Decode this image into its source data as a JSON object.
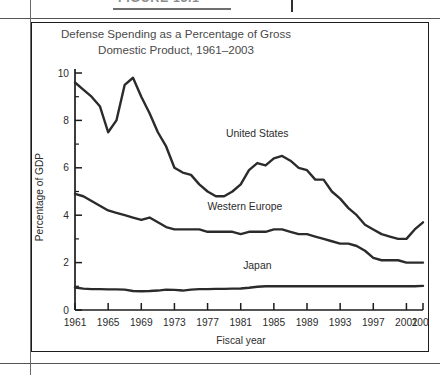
{
  "figure": {
    "caption": "FIGURE 13.1",
    "title_line1": "Defense Spending as a Percentage of Gross",
    "title_line2": "Domestic Product, 1961–2003"
  },
  "chart_data": {
    "type": "line",
    "title": "Defense Spending as a Percentage of Gross Domestic Product, 1961–2003",
    "xlabel": "Fiscal year",
    "ylabel": "Percentage of GDP",
    "xlim": [
      1961,
      2003
    ],
    "ylim": [
      0,
      10
    ],
    "grid": false,
    "legend": "inline labels on series",
    "y_ticks": [
      0,
      2,
      4,
      6,
      8,
      10
    ],
    "y_tick_labels": [
      "0",
      "2",
      "4",
      "6",
      "8",
      "10"
    ],
    "y_minor_ticks": [
      1,
      3,
      5,
      7,
      9
    ],
    "x_ticks": [
      1961,
      1965,
      1969,
      1973,
      1977,
      1981,
      1985,
      1989,
      1993,
      1997,
      2001,
      2003
    ],
    "x_tick_labels": [
      "1961",
      "1965",
      "1969",
      "1973",
      "1977",
      "1981",
      "1985",
      "1989",
      "1993",
      "1997",
      "2001",
      "2003"
    ],
    "x": [
      1961,
      1962,
      1963,
      1964,
      1965,
      1966,
      1967,
      1968,
      1969,
      1970,
      1971,
      1972,
      1973,
      1974,
      1975,
      1976,
      1977,
      1978,
      1979,
      1980,
      1981,
      1982,
      1983,
      1984,
      1985,
      1986,
      1987,
      1988,
      1989,
      1990,
      1991,
      1992,
      1993,
      1994,
      1995,
      1996,
      1997,
      1998,
      1999,
      2000,
      2001,
      2002,
      2003
    ],
    "series": [
      {
        "name": "United States",
        "label": "United States",
        "color": "#2b2b2b",
        "values": [
          9.6,
          9.3,
          9.0,
          8.6,
          7.5,
          8.0,
          9.5,
          9.8,
          9.0,
          8.3,
          7.5,
          6.9,
          6.0,
          5.8,
          5.7,
          5.3,
          5.0,
          4.8,
          4.8,
          5.0,
          5.3,
          5.9,
          6.2,
          6.1,
          6.4,
          6.5,
          6.3,
          6.0,
          5.9,
          5.5,
          5.5,
          5.0,
          4.7,
          4.3,
          4.0,
          3.6,
          3.4,
          3.2,
          3.1,
          3.0,
          3.0,
          3.4,
          3.7
        ]
      },
      {
        "name": "Western Europe",
        "label": "Western Europe",
        "color": "#2b2b2b",
        "values": [
          4.9,
          4.8,
          4.6,
          4.4,
          4.2,
          4.1,
          4.0,
          3.9,
          3.8,
          3.9,
          3.7,
          3.5,
          3.4,
          3.4,
          3.4,
          3.4,
          3.3,
          3.3,
          3.3,
          3.3,
          3.2,
          3.3,
          3.3,
          3.3,
          3.4,
          3.4,
          3.3,
          3.2,
          3.2,
          3.1,
          3.0,
          2.9,
          2.8,
          2.8,
          2.7,
          2.5,
          2.2,
          2.1,
          2.1,
          2.1,
          2.0,
          2.0,
          2.0
        ]
      },
      {
        "name": "Japan",
        "label": "Japan",
        "color": "#2b2b2b",
        "values": [
          0.95,
          0.9,
          0.88,
          0.88,
          0.87,
          0.87,
          0.86,
          0.8,
          0.79,
          0.8,
          0.82,
          0.86,
          0.85,
          0.82,
          0.86,
          0.88,
          0.88,
          0.89,
          0.89,
          0.9,
          0.91,
          0.94,
          0.98,
          1.0,
          1.0,
          1.0,
          1.0,
          1.0,
          1.0,
          1.0,
          1.0,
          1.0,
          1.0,
          1.0,
          1.0,
          1.0,
          1.0,
          1.0,
          1.0,
          1.0,
          1.0,
          1.0,
          1.02
        ]
      }
    ],
    "annotations": [
      {
        "text": "United States",
        "x": 1983,
        "y": 7.3
      },
      {
        "text": "Western Europe",
        "x": 1981.5,
        "y": 4.2
      },
      {
        "text": "Japan",
        "x": 1983,
        "y": 1.75
      }
    ]
  }
}
